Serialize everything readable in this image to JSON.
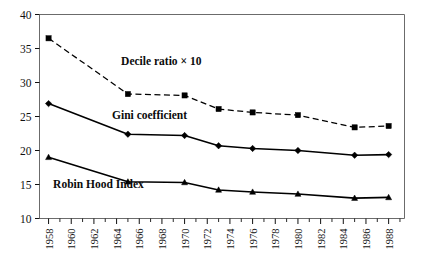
{
  "chart_data": {
    "type": "line",
    "title": "",
    "subtitle": "",
    "xlabel": "",
    "ylabel": "",
    "xlim": [
      1957.2,
      1989.4
    ],
    "ylim": [
      10,
      40
    ],
    "y_ticks": [
      10,
      15,
      20,
      25,
      30,
      35,
      40
    ],
    "x_ticks": [
      1958,
      1960,
      1962,
      1964,
      1966,
      1968,
      1970,
      1972,
      1974,
      1976,
      1978,
      1980,
      1982,
      1984,
      1986,
      1988
    ],
    "x_minor_ticks": [
      1959,
      1961,
      1963,
      1965,
      1967,
      1969,
      1971,
      1973,
      1975,
      1977,
      1979,
      1981,
      1983,
      1985,
      1987,
      1989
    ],
    "x_tick_labels": [
      "1958",
      "1960",
      "1962",
      "1964",
      "1966",
      "1968",
      "1970",
      "1972",
      "1974",
      "1976",
      "1978",
      "1980",
      "1982",
      "1984",
      "1986",
      "1988"
    ],
    "y_tick_labels": [
      "10",
      "15",
      "20",
      "25",
      "30",
      "35",
      "40"
    ],
    "grid": false,
    "legend_position": "inline-annotations",
    "x": [
      1958,
      1965,
      1970,
      1973,
      1976,
      1980,
      1985,
      1988
    ],
    "series": [
      {
        "name": "Decile ratio × 10",
        "values": [
          36.5,
          28.3,
          28.1,
          26.1,
          25.6,
          25.2,
          23.4,
          23.6
        ],
        "line_style": "dashed",
        "marker": "square",
        "color": "#000000",
        "label_x": 1964.4,
        "label_y": 32.6
      },
      {
        "name": "Gini coefficient",
        "values": [
          26.9,
          22.4,
          22.2,
          20.7,
          20.3,
          20.0,
          19.3,
          19.4
        ],
        "line_style": "solid",
        "marker": "diamond",
        "color": "#000000",
        "label_x": 1963.6,
        "label_y": 24.6
      },
      {
        "name": "Robin Hood Index",
        "values": [
          19.0,
          15.4,
          15.3,
          14.2,
          13.9,
          13.6,
          13.0,
          13.1
        ],
        "line_style": "solid",
        "marker": "triangle",
        "color": "#000000",
        "label_x": 1958.4,
        "label_y": 14.5
      }
    ]
  },
  "frame": {
    "border_color": "#6b6b6b",
    "background": "#ffffff"
  }
}
